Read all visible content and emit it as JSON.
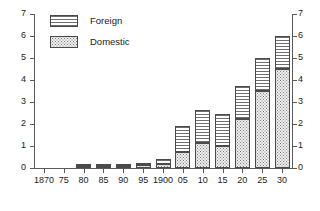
{
  "chart_data": {
    "type": "bar",
    "subtype": "stacked-bar",
    "title": "",
    "xlabel": "",
    "ylabel": "",
    "ylim": [
      0,
      7
    ],
    "ytick_step": 1,
    "grid": false,
    "dual_y_axis": true,
    "legend_position": "top-left-inside",
    "categories": [
      "1870",
      "75",
      "80",
      "85",
      "90",
      "95",
      "1900",
      "05",
      "10",
      "15",
      "20",
      "25",
      "30"
    ],
    "ytick_labels_left": [
      "7",
      "6",
      "5",
      "4",
      "3",
      "2",
      "1",
      "0"
    ],
    "ytick_labels_right": [
      "7",
      "6",
      "5",
      "4",
      "3",
      "2",
      "1",
      "0"
    ],
    "ytick_values": [
      7,
      6,
      5,
      4,
      3,
      2,
      1,
      0
    ],
    "series": [
      {
        "name": "Domestic",
        "pattern": "dotted",
        "values": [
          0.0,
          0.0,
          0.1,
          0.1,
          0.1,
          0.12,
          0.18,
          0.75,
          1.15,
          1.0,
          2.25,
          3.5,
          4.5
        ]
      },
      {
        "name": "Foreign",
        "pattern": "horizontal-lines",
        "values": [
          0.0,
          0.0,
          0.1,
          0.1,
          0.1,
          0.13,
          0.22,
          1.15,
          1.5,
          1.45,
          1.5,
          1.5,
          1.5
        ]
      }
    ],
    "totals": [
      0.0,
      0.0,
      0.2,
      0.2,
      0.2,
      0.25,
      0.4,
      1.9,
      2.65,
      2.45,
      3.75,
      5.0,
      6.0
    ]
  },
  "legend": {
    "items": [
      {
        "label": "Foreign",
        "swatch": "foreign-swatch"
      },
      {
        "label": "Domestic",
        "swatch": "domestic-swatch"
      }
    ]
  },
  "colors": {
    "axis": "#5a5a5a",
    "bar_outline": "#4a4a4a",
    "hatch": "#6e6e6e",
    "background": "#ffffff",
    "text": "#1a1a1a"
  }
}
